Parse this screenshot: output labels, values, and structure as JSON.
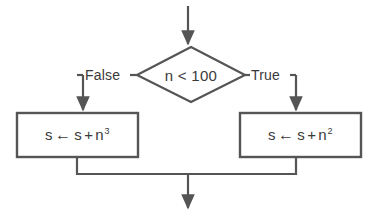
{
  "diagram": {
    "type": "flowchart",
    "stroke_color": "#555555",
    "fill_color": "#ffffff",
    "text_color": "#3a3a3a",
    "background_color": "#ffffff"
  },
  "entry": {
    "name": "entry-arrow",
    "direction": "down"
  },
  "decision": {
    "shape": "diamond",
    "condition": "n < 100",
    "condition_parts": {
      "variable": "n",
      "operator": "<",
      "value": "100"
    }
  },
  "branches": [
    {
      "label": "False",
      "side": "left",
      "target": "process-left"
    },
    {
      "label": "True",
      "side": "right",
      "target": "process-right"
    }
  ],
  "processes": [
    {
      "id": "process-left",
      "shape": "rectangle",
      "expression": "s ← s + n³",
      "parts": {
        "target": "s",
        "assign": "←",
        "operand": "s",
        "plus": "+",
        "base": "n",
        "exponent": "3"
      }
    },
    {
      "id": "process-right",
      "shape": "rectangle",
      "expression": "s ← s + n²",
      "parts": {
        "target": "s",
        "assign": "←",
        "operand": "s",
        "plus": "+",
        "base": "n",
        "exponent": "2"
      }
    }
  ],
  "merge": {
    "name": "merge-junction",
    "exit_direction": "down"
  }
}
